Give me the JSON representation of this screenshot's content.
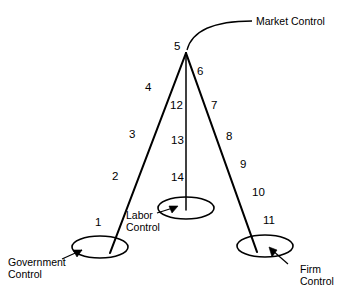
{
  "diagram": {
    "type": "node-link-diagram",
    "background_color": "#ffffff",
    "line_color": "#000000",
    "nodes": [
      {
        "id": "apex",
        "label": "5",
        "shape": "vertex",
        "x": 186,
        "y": 52
      },
      {
        "id": "government",
        "label": "",
        "shape": "ellipse",
        "x": 100,
        "y": 247,
        "rx": 28,
        "ry": 11
      },
      {
        "id": "labor",
        "label": "",
        "shape": "ellipse",
        "x": 186,
        "y": 208,
        "rx": 28,
        "ry": 11
      },
      {
        "id": "firm",
        "label": "",
        "shape": "ellipse",
        "x": 265,
        "y": 246,
        "rx": 28,
        "ry": 11
      }
    ],
    "edge_labels": {
      "left_branch": [
        "1",
        "2",
        "3",
        "4"
      ],
      "center_branch": [
        "12",
        "13",
        "14"
      ],
      "right_branch": [
        "6",
        "7",
        "8",
        "9",
        "10",
        "11"
      ],
      "apex": "5"
    },
    "numbers": [
      {
        "text": "1",
        "x": 95,
        "y": 216
      },
      {
        "text": "2",
        "x": 112,
        "y": 170
      },
      {
        "text": "3",
        "x": 129,
        "y": 128
      },
      {
        "text": "4",
        "x": 145,
        "y": 81
      },
      {
        "text": "5",
        "x": 174,
        "y": 40
      },
      {
        "text": "6",
        "x": 197,
        "y": 65
      },
      {
        "text": "7",
        "x": 211,
        "y": 99
      },
      {
        "text": "8",
        "x": 226,
        "y": 130
      },
      {
        "text": "9",
        "x": 240,
        "y": 158
      },
      {
        "text": "10",
        "x": 252,
        "y": 186
      },
      {
        "text": "11",
        "x": 263,
        "y": 214
      },
      {
        "text": "12",
        "x": 170,
        "y": 99
      },
      {
        "text": "13",
        "x": 171,
        "y": 134
      },
      {
        "text": "14",
        "x": 171,
        "y": 171
      }
    ],
    "callouts": [
      {
        "id": "market-control",
        "text": "Market Control",
        "x": 256,
        "y": 16,
        "align": "left"
      },
      {
        "id": "government-control",
        "text": "Government\nControl",
        "x": 8,
        "y": 257,
        "align": "left"
      },
      {
        "id": "labor-control",
        "text": "Labor\nControl",
        "x": 126,
        "y": 210,
        "align": "left"
      },
      {
        "id": "firm-control",
        "text": "Firm\nControl",
        "x": 300,
        "y": 264,
        "align": "left"
      }
    ]
  }
}
